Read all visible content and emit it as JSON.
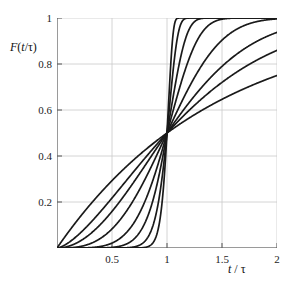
{
  "figure": {
    "background_color": "#ffffff",
    "curve_color": "#1a1a1a",
    "grid_color": "#c9c9c9",
    "axis_color": "#9a9a9a"
  },
  "axes": {
    "y_title_parts": {
      "f": "F",
      "open": "(",
      "t": "t",
      "slash": "/",
      "tau": "τ",
      "close": ")"
    },
    "y_title_plain": "F(t/τ)",
    "x_title_parts": {
      "t": "t",
      "slash": "/",
      "tau": "τ"
    },
    "x_title_plain": "t / τ",
    "x_tick_labels": [
      "0.5",
      "1",
      "1.5",
      "2"
    ],
    "x_tick_values": [
      0.5,
      1,
      1.5,
      2
    ],
    "y_tick_labels": [
      "0.2",
      "0.4",
      "0.6",
      "0.8",
      "1"
    ],
    "y_tick_values": [
      0.2,
      0.4,
      0.6,
      0.8,
      1
    ]
  },
  "chart_data": {
    "type": "line",
    "title": "",
    "subtitle": "",
    "xlabel": "t / τ",
    "ylabel": "F(t/τ)",
    "xlim": [
      0,
      2
    ],
    "ylim": [
      0,
      1
    ],
    "grid": true,
    "legend": "none",
    "annotations": [
      "All curves intersect at (1, 0.5)",
      "Family of Weibull-type cumulative distributions with increasing shape parameter"
    ],
    "model": {
      "name": "weibull-cdf-normalized",
      "formula": "F(x) = 1 - 2^(-x^beta)",
      "crossing_point": {
        "x": 1.0,
        "y": 0.5
      }
    },
    "series": [
      {
        "name": "beta = 1",
        "beta": 1,
        "x": [
          0,
          0.1,
          0.2,
          0.3,
          0.4,
          0.5,
          0.6,
          0.7,
          0.8,
          0.9,
          1.0,
          1.1,
          1.2,
          1.3,
          1.4,
          1.5,
          1.6,
          1.7,
          1.8,
          1.9,
          2.0
        ],
        "values": [
          0.0,
          0.067,
          0.129,
          0.188,
          0.242,
          0.293,
          0.341,
          0.385,
          0.426,
          0.464,
          0.5,
          0.533,
          0.565,
          0.594,
          0.621,
          0.646,
          0.67,
          0.692,
          0.713,
          0.732,
          0.75
        ]
      },
      {
        "name": "beta = 1.5",
        "beta": 1.5,
        "x": [
          0,
          0.1,
          0.2,
          0.3,
          0.4,
          0.5,
          0.6,
          0.7,
          0.8,
          0.9,
          1.0,
          1.1,
          1.2,
          1.3,
          1.4,
          1.5,
          1.6,
          1.7,
          1.8,
          1.9,
          2.0
        ],
        "values": [
          0.0,
          0.022,
          0.06,
          0.109,
          0.165,
          0.224,
          0.285,
          0.346,
          0.404,
          0.46,
          0.5,
          0.562,
          0.609,
          0.653,
          0.693,
          0.729,
          0.762,
          0.791,
          0.817,
          0.84,
          0.861
        ]
      },
      {
        "name": "beta = 2",
        "beta": 2,
        "x": [
          0,
          0.1,
          0.2,
          0.3,
          0.4,
          0.5,
          0.6,
          0.7,
          0.8,
          0.9,
          1.0,
          1.1,
          1.2,
          1.3,
          1.4,
          1.5,
          1.6,
          1.7,
          1.8,
          1.9,
          2.0
        ],
        "values": [
          0.0,
          0.007,
          0.027,
          0.061,
          0.105,
          0.159,
          0.221,
          0.288,
          0.357,
          0.429,
          0.5,
          0.568,
          0.632,
          0.691,
          0.744,
          0.791,
          0.831,
          0.866,
          0.895,
          0.919,
          0.938
        ]
      },
      {
        "name": "beta = 3",
        "beta": 3,
        "x": [
          0,
          0.1,
          0.2,
          0.3,
          0.4,
          0.5,
          0.6,
          0.7,
          0.8,
          0.9,
          1.0,
          1.1,
          1.2,
          1.3,
          1.4,
          1.5,
          1.6,
          1.7,
          1.8,
          1.9,
          2.0
        ],
        "values": [
          0.0,
          0.001,
          0.006,
          0.018,
          0.043,
          0.083,
          0.14,
          0.213,
          0.3,
          0.397,
          0.5,
          0.6,
          0.693,
          0.773,
          0.84,
          0.891,
          0.93,
          0.957,
          0.975,
          0.986,
          0.993
        ]
      },
      {
        "name": "beta = 5",
        "beta": 5,
        "x": [
          0,
          0.1,
          0.2,
          0.3,
          0.4,
          0.5,
          0.6,
          0.7,
          0.8,
          0.9,
          1.0,
          1.1,
          1.2,
          1.3,
          1.4,
          1.5,
          1.6,
          1.7,
          1.8,
          1.9,
          2.0
        ],
        "values": [
          0.0,
          0.0,
          0.0,
          0.002,
          0.007,
          0.021,
          0.052,
          0.109,
          0.199,
          0.329,
          0.5,
          0.684,
          0.842,
          0.939,
          0.983,
          0.997,
          1.0,
          1.0,
          1.0,
          1.0,
          1.0
        ]
      },
      {
        "name": "beta = 8",
        "beta": 8,
        "x": [
          0,
          0.1,
          0.2,
          0.3,
          0.4,
          0.5,
          0.6,
          0.7,
          0.8,
          0.9,
          1.0,
          1.1,
          1.2,
          1.3,
          1.4,
          1.5,
          1.6,
          1.7,
          1.8,
          1.9,
          2.0
        ],
        "values": [
          0.0,
          0.0,
          0.0,
          0.0,
          0.0,
          0.003,
          0.012,
          0.039,
          0.113,
          0.273,
          0.5,
          0.766,
          0.944,
          0.995,
          1.0,
          1.0,
          1.0,
          1.0,
          1.0,
          1.0,
          1.0
        ]
      },
      {
        "name": "beta = 14",
        "beta": 14,
        "x": [
          0,
          0.1,
          0.2,
          0.3,
          0.4,
          0.5,
          0.6,
          0.7,
          0.8,
          0.9,
          1.0,
          1.1,
          1.2,
          1.3,
          1.4,
          1.5,
          1.6,
          1.7,
          1.8,
          1.9,
          2.0
        ],
        "values": [
          0.0,
          0.0,
          0.0,
          0.0,
          0.0,
          0.0,
          0.001,
          0.006,
          0.04,
          0.2,
          0.5,
          0.861,
          0.993,
          1.0,
          1.0,
          1.0,
          1.0,
          1.0,
          1.0,
          1.0,
          1.0
        ]
      },
      {
        "name": "beta = 25",
        "beta": 25,
        "x": [
          0,
          0.1,
          0.2,
          0.3,
          0.4,
          0.5,
          0.6,
          0.7,
          0.8,
          0.9,
          1.0,
          1.1,
          1.2,
          1.3,
          1.4,
          1.5,
          1.6,
          1.7,
          1.8,
          1.9,
          2.0
        ],
        "values": [
          0.0,
          0.0,
          0.0,
          0.0,
          0.0,
          0.0,
          0.0,
          0.0,
          0.003,
          0.095,
          0.5,
          0.977,
          1.0,
          1.0,
          1.0,
          1.0,
          1.0,
          1.0,
          1.0,
          1.0,
          1.0
        ]
      }
    ]
  }
}
